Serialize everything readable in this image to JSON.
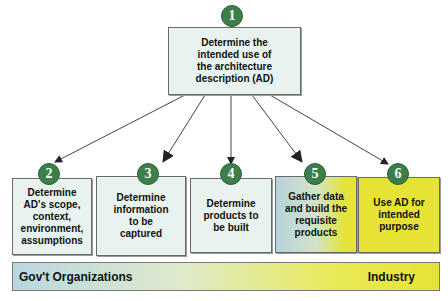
{
  "diagram": {
    "steps": [
      {
        "number": "1",
        "text": "Determine the\nintended use of\nthe architecture\ndescription (AD)"
      },
      {
        "number": "2",
        "text": "Determine\nAD's scope,\ncontext,\nenvironment,\nassumptions"
      },
      {
        "number": "3",
        "text": "Determine\ninformation\nto be\ncaptured"
      },
      {
        "number": "4",
        "text": "Determine\nproducts to\nbe built"
      },
      {
        "number": "5",
        "text": "Gather data\nand build the\nrequisite\nproducts"
      },
      {
        "number": "6",
        "text": "Use AD for\nintended\npurpose"
      }
    ],
    "banner": {
      "left_label": "Gov't Organizations",
      "right_label": "Industry"
    },
    "colors": {
      "box_light": "#e8f3ef",
      "box_yellow": "#e6e334",
      "circle_green": "#3d7f4a",
      "banner_left": "#b9d7e0",
      "banner_right": "#e6e334"
    }
  }
}
